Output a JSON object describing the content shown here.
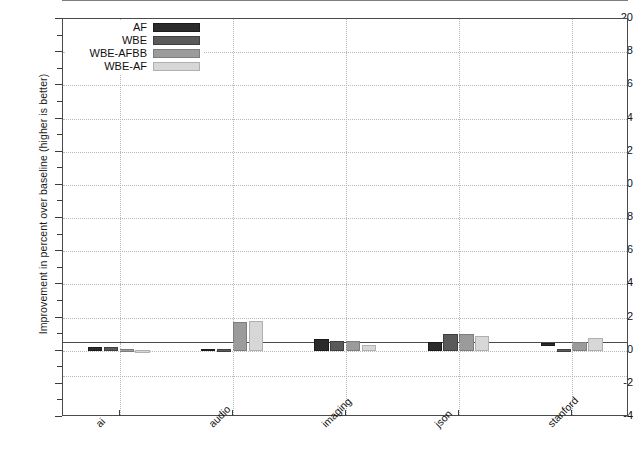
{
  "chart_data": {
    "type": "bar",
    "title": "",
    "xlabel": "",
    "ylabel": "Improvement in percent over baseline (higher is better)",
    "categories": [
      "ai",
      "audio",
      "imaging",
      "json",
      "stanford"
    ],
    "series": [
      {
        "name": "AF",
        "color": "#2b2b2b",
        "values": [
          0.25,
          0.12,
          0.7,
          0.5,
          -0.18
        ]
      },
      {
        "name": "WBE",
        "color": "#5a5a5a",
        "values": [
          0.2,
          0.1,
          0.6,
          1.0,
          0.08
        ]
      },
      {
        "name": "WBE-AFBB",
        "color": "#9b9b9b",
        "values": [
          0.1,
          1.75,
          0.6,
          1.0,
          0.55
        ]
      },
      {
        "name": "WBE-AF",
        "color": "#d7d7d7",
        "values": [
          0.02,
          1.8,
          0.35,
          0.9,
          0.75
        ]
      }
    ],
    "ylim": [
      -4,
      20
    ],
    "ytick_step": 2,
    "yticks": [
      20,
      18,
      16,
      14,
      12,
      10,
      8,
      6,
      4,
      2,
      0,
      -2,
      -4
    ],
    "ytick_labels": [
      "20",
      "18",
      "16",
      "14",
      "12",
      "10",
      "8",
      "6",
      "4",
      "2",
      "0",
      "-2",
      "-4"
    ],
    "grid": true,
    "grid_style": "dotted",
    "legend_position": "upper-left",
    "zero_line": true,
    "xtick_label_rotation": -45
  },
  "legend": {
    "entries": [
      {
        "label": "AF"
      },
      {
        "label": "WBE"
      },
      {
        "label": "WBE-AFBB"
      },
      {
        "label": "WBE-AF"
      }
    ]
  }
}
